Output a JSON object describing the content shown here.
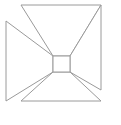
{
  "figure": {
    "name": "pinwheel-cross-line-drawing",
    "background_color": "#ffffff",
    "stroke_color": "#9a9a9a",
    "fill_color": "#ffffff",
    "stroke_width": 1,
    "canvas": {
      "width": 121,
      "height": 125
    },
    "viewbox": "0 0 121 125",
    "outer_bounds": {
      "left": 6,
      "top": 5,
      "right": 101,
      "bottom": 101
    },
    "center_square": {
      "left": 53,
      "top": 56,
      "right": 70,
      "bottom": 72
    },
    "shapes": [
      {
        "name": "top-flare",
        "label": "Top trapezoid flare",
        "points": "21,5 101,5 70,56 53,56"
      },
      {
        "name": "left-flare",
        "label": "Left trapezoid flare",
        "points": "6,21 53,56 53,72 6,101"
      },
      {
        "name": "right-flare",
        "label": "Right trapezoid flare",
        "points": "101,5 101,90 70,72 70,56"
      },
      {
        "name": "bottom-flare",
        "label": "Bottom trapezoid flare",
        "points": "53,72 70,72 101,101 21,101"
      },
      {
        "name": "center-square",
        "label": "Center square",
        "points": "53,56 70,56 70,72 53,72"
      }
    ]
  }
}
